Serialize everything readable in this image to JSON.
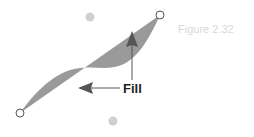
{
  "figure": {
    "caption": "Figure 2.32",
    "annotation_label": "Fill",
    "colors": {
      "fill": "#9a9a9a",
      "control_point": "#d0d0d0",
      "anchor_stroke": "#555555",
      "anchor_fill": "#ffffff",
      "arrow": "#555555",
      "label": "#222222",
      "caption": "#d9d9d9"
    },
    "elements": {
      "anchor_points": [
        "start-anchor",
        "end-anchor"
      ],
      "control_points": [
        "control-point-1",
        "control-point-2"
      ],
      "arrows": [
        "arrow-to-lower-fill",
        "arrow-to-upper-fill"
      ]
    }
  }
}
